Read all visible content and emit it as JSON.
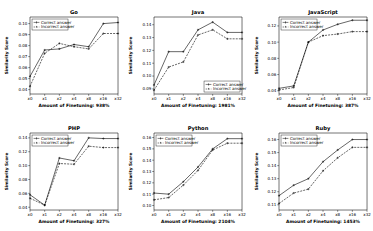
{
  "figure": {
    "legend_labels": [
      "Correct answer",
      "Incorrect answer"
    ],
    "ylabel": "Similarity Score",
    "xlabel_prefix": "Amount of Finetuning: ",
    "xticks": [
      "x0",
      "x1",
      "x2",
      "x4",
      "x8",
      "x16",
      "x32"
    ]
  },
  "chart_data": [
    {
      "type": "line",
      "title": "Go",
      "xlabel": "Amount of Finetuning: 938%",
      "ylabel": "Similarity Score",
      "categories": [
        "x0",
        "x1",
        "x2",
        "x4",
        "x8",
        "x16",
        "x32"
      ],
      "yticks": [
        0.04,
        0.05,
        0.06,
        0.07,
        0.08,
        0.09,
        0.1
      ],
      "ylim": [
        0.036,
        0.106
      ],
      "legend_position": "upper left",
      "grid": false,
      "series": [
        {
          "name": "Correct answer",
          "values": [
            0.052,
            0.076,
            0.077,
            0.081,
            0.079,
            0.1,
            0.101
          ]
        },
        {
          "name": "Incorrect answer",
          "values": [
            0.043,
            0.073,
            0.082,
            0.079,
            0.077,
            0.091,
            0.091
          ]
        }
      ]
    },
    {
      "type": "line",
      "title": "Java",
      "xlabel": "Amount of Finetuning: 1981%",
      "ylabel": "Similarity Score",
      "categories": [
        "x0",
        "x1",
        "x2",
        "x4",
        "x8",
        "x16",
        "x32"
      ],
      "yticks": [
        0.09,
        0.1,
        0.11,
        0.12,
        0.13,
        0.14
      ],
      "ylim": [
        0.086,
        0.146
      ],
      "legend_position": "lower right",
      "grid": false,
      "series": [
        {
          "name": "Correct answer",
          "values": [
            0.093,
            0.119,
            0.119,
            0.136,
            0.142,
            0.134,
            0.134
          ]
        },
        {
          "name": "Incorrect answer",
          "values": [
            0.089,
            0.107,
            0.111,
            0.132,
            0.136,
            0.129,
            0.129
          ]
        }
      ]
    },
    {
      "type": "line",
      "title": "JavaScript",
      "xlabel": "Amount of Finetuning: 387%",
      "ylabel": "Similarity Score",
      "categories": [
        "x0",
        "x1",
        "x2",
        "x4",
        "x8",
        "x16",
        "x32"
      ],
      "yticks": [
        0.04,
        0.06,
        0.08,
        0.1,
        0.12
      ],
      "ylim": [
        0.036,
        0.131
      ],
      "legend_position": "upper left",
      "grid": false,
      "series": [
        {
          "name": "Correct answer",
          "values": [
            0.043,
            0.046,
            0.1,
            0.115,
            0.122,
            0.127,
            0.127
          ]
        },
        {
          "name": "Incorrect answer",
          "values": [
            0.041,
            0.044,
            0.1,
            0.108,
            0.11,
            0.113,
            0.113
          ]
        }
      ]
    },
    {
      "type": "line",
      "title": "PHP",
      "xlabel": "Amount of Finetuning: 327%",
      "ylabel": "Similarity Score",
      "categories": [
        "x0",
        "x1",
        "x2",
        "x4",
        "x8",
        "x16",
        "x32"
      ],
      "yticks": [
        0.04,
        0.06,
        0.08,
        0.1,
        0.12,
        0.14
      ],
      "ylim": [
        0.036,
        0.147
      ],
      "legend_position": "upper left",
      "grid": false,
      "series": [
        {
          "name": "Correct answer",
          "values": [
            0.058,
            0.043,
            0.111,
            0.107,
            0.14,
            0.139,
            0.139
          ]
        },
        {
          "name": "Incorrect answer",
          "values": [
            0.053,
            0.043,
            0.103,
            0.102,
            0.128,
            0.126,
            0.126
          ]
        }
      ]
    },
    {
      "type": "line",
      "title": "Python",
      "xlabel": "Amount of Finetuning: 2104%",
      "ylabel": "Similarity Score",
      "categories": [
        "x0",
        "x1",
        "x2",
        "x4",
        "x8",
        "x16",
        "x32"
      ],
      "yticks": [
        0.1,
        0.11,
        0.12,
        0.13,
        0.14,
        0.15,
        0.16
      ],
      "ylim": [
        0.096,
        0.164
      ],
      "legend_position": "upper left",
      "grid": false,
      "series": [
        {
          "name": "Correct answer",
          "values": [
            0.111,
            0.11,
            0.121,
            0.134,
            0.15,
            0.159,
            0.159
          ]
        },
        {
          "name": "Incorrect answer",
          "values": [
            0.105,
            0.107,
            0.118,
            0.131,
            0.149,
            0.155,
            0.155
          ]
        }
      ]
    },
    {
      "type": "line",
      "title": "Ruby",
      "xlabel": "Amount of Finetuning: 1453%",
      "ylabel": "Similarity Score",
      "categories": [
        "x0",
        "x1",
        "x2",
        "x4",
        "x8",
        "x16",
        "x32"
      ],
      "yticks": [
        0.11,
        0.12,
        0.13,
        0.14,
        0.15,
        0.16
      ],
      "ylim": [
        0.106,
        0.165
      ],
      "legend_position": "upper left",
      "grid": false,
      "series": [
        {
          "name": "Correct answer",
          "values": [
            0.117,
            0.125,
            0.13,
            0.143,
            0.152,
            0.16,
            0.16
          ]
        },
        {
          "name": "Incorrect answer",
          "values": [
            0.111,
            0.119,
            0.122,
            0.136,
            0.146,
            0.154,
            0.154
          ]
        }
      ]
    }
  ]
}
